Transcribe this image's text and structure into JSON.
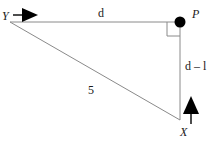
{
  "figure": {
    "type": "geometry-diagram",
    "background_color": "#ffffff",
    "line_color": "#8a8a8a",
    "marker_color": "#000000",
    "text_color": "#1a1a1a",
    "vertices": [
      {
        "id": "Y",
        "label": "Y",
        "x": 10,
        "y": 22,
        "style": "italic"
      },
      {
        "id": "P",
        "label": "P",
        "x": 180,
        "y": 22,
        "style": "italic"
      },
      {
        "id": "X",
        "label": "X",
        "x": 180,
        "y": 120,
        "style": "italic"
      }
    ],
    "edges": [
      {
        "id": "YP",
        "from": "Y",
        "to": "P",
        "label": "d",
        "orientation": "horizontal"
      },
      {
        "id": "PX",
        "from": "P",
        "to": "X",
        "label": "d – l",
        "orientation": "vertical"
      },
      {
        "id": "YX",
        "from": "Y",
        "to": "X",
        "label": "5",
        "orientation": "hypotenuse"
      }
    ],
    "labels": {
      "vertex_y": "Y",
      "vertex_p": "P",
      "vertex_x": "X",
      "side_top": "d",
      "side_right": "d – l",
      "side_hypotenuse": "5"
    },
    "markers": {
      "right_angle": {
        "at": "P",
        "type": "right-angle-square"
      },
      "point_dot": {
        "at": "P",
        "type": "filled-circle"
      },
      "arrow_y": {
        "at": "Y",
        "type": "arrow-right",
        "filled": true
      },
      "arrow_x": {
        "at": "X",
        "type": "arrow-up",
        "filled": true
      }
    }
  }
}
